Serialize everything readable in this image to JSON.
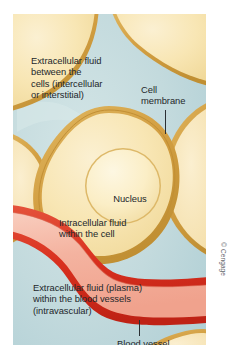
{
  "figure": {
    "credit": "© Cengage"
  },
  "labels": {
    "extracellular_interstitial": "Extracellular fluid\nbetween the\ncells (intercellular\nor interstitial)",
    "cell_membrane": "Cell\nmembrane",
    "nucleus": "Nucleus",
    "intracellular": "Intracellular fluid\nwithin the cell",
    "extracellular_plasma": "Extracellular fluid (plasma)\nwithin the blood vessels\n(intravascular)",
    "blood_vessel": "Blood vessel"
  },
  "colors": {
    "interstitial_fluid": "#bdd8dc",
    "interstitial_fluid_light": "#cfe3e4",
    "cytoplasm": "#f7e3ad",
    "cytoplasm_light": "#faeec9",
    "cell_membrane": "#d9a94e",
    "cell_membrane_dark": "#c28f34",
    "nucleus_fill": "#fbeec6",
    "nucleus_edge": "#ddb868",
    "plasma": "#f4b6a4",
    "plasma_light": "#f8cdbd",
    "vessel_wall": "#e03c28",
    "vessel_wall_dark": "#b92216",
    "text": "#23272b",
    "page_background": "#ffffff",
    "credit_text": "#5f6469"
  },
  "structures": [
    {
      "name": "cell-top-left",
      "type": "cell"
    },
    {
      "name": "cell-top-right",
      "type": "cell"
    },
    {
      "name": "cell-center",
      "type": "cell"
    },
    {
      "name": "cell-right-middle",
      "type": "cell"
    },
    {
      "name": "cell-left-lower",
      "type": "cell"
    },
    {
      "name": "cell-bottom-right",
      "type": "cell"
    },
    {
      "name": "blood-vessel",
      "type": "vessel"
    },
    {
      "name": "nucleus",
      "type": "organelle"
    }
  ]
}
